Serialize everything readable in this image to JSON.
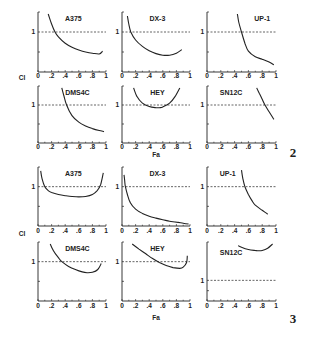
{
  "figures": [
    {
      "number": "2",
      "ylabel": "CI",
      "xlabel": "Fa",
      "panels": [
        {
          "title": "A375",
          "row": 0,
          "col": 0
        },
        {
          "title": "DX-3",
          "row": 0,
          "col": 1
        },
        {
          "title": "UP-1",
          "row": 0,
          "col": 2
        },
        {
          "title": "DMS4C",
          "row": 1,
          "col": 0
        },
        {
          "title": "HEY",
          "row": 1,
          "col": 1
        },
        {
          "title": "SN12C",
          "row": 1,
          "col": 2
        }
      ]
    },
    {
      "number": "3",
      "ylabel": "CI",
      "xlabel": "Fa",
      "panels": [
        {
          "title": "A375",
          "row": 0,
          "col": 0
        },
        {
          "title": "DX-3",
          "row": 0,
          "col": 1
        },
        {
          "title": "UP-1",
          "row": 0,
          "col": 2
        },
        {
          "title": "DMS4C",
          "row": 1,
          "col": 0
        },
        {
          "title": "HEY",
          "row": 1,
          "col": 1
        },
        {
          "title": "SN12C",
          "row": 1,
          "col": 2
        }
      ]
    }
  ],
  "x_tick_labels": [
    "0",
    ".2",
    ".4",
    ".6",
    ".8",
    "1"
  ],
  "y_tick_label": "1",
  "chart_data": [
    {
      "type": "line",
      "title": "Figure 2",
      "xlabel": "Fa",
      "ylabel": "CI",
      "xlim": [
        0,
        1
      ],
      "ylim": [
        0,
        1.5
      ],
      "reference_line": {
        "y": 1,
        "style": "dashed"
      },
      "grid": false,
      "series": [
        {
          "name": "A375",
          "x": [
            0.15,
            0.2,
            0.25,
            0.3,
            0.4,
            0.5,
            0.6,
            0.7,
            0.8,
            0.9,
            0.95
          ],
          "y": [
            1.45,
            1.2,
            1.0,
            0.88,
            0.72,
            0.62,
            0.55,
            0.5,
            0.47,
            0.45,
            0.52
          ]
        },
        {
          "name": "DX-3",
          "x": [
            0.08,
            0.1,
            0.13,
            0.2,
            0.3,
            0.4,
            0.5,
            0.6,
            0.7,
            0.8,
            0.88
          ],
          "y": [
            1.4,
            1.2,
            1.0,
            0.8,
            0.64,
            0.53,
            0.46,
            0.42,
            0.42,
            0.47,
            0.56
          ]
        },
        {
          "name": "UP-1",
          "x": [
            0.44,
            0.46,
            0.5,
            0.55,
            0.6,
            0.7,
            0.8,
            0.9,
            0.97
          ],
          "y": [
            1.45,
            1.25,
            1.0,
            0.72,
            0.52,
            0.38,
            0.32,
            0.25,
            0.18
          ]
        },
        {
          "name": "DMS4C",
          "x": [
            0.35,
            0.38,
            0.42,
            0.5,
            0.6,
            0.7,
            0.8,
            0.9,
            0.97
          ],
          "y": [
            1.45,
            1.25,
            1.0,
            0.72,
            0.55,
            0.45,
            0.38,
            0.33,
            0.3
          ]
        },
        {
          "name": "HEY",
          "x": [
            0.17,
            0.22,
            0.3,
            0.4,
            0.5,
            0.55,
            0.6,
            0.7,
            0.78,
            0.85
          ],
          "y": [
            1.45,
            1.22,
            1.05,
            0.96,
            0.93,
            0.93,
            0.95,
            1.05,
            1.22,
            1.45
          ]
        },
        {
          "name": "SN12C",
          "x": [
            0.72,
            0.76,
            0.8,
            0.84,
            0.9,
            0.97
          ],
          "y": [
            1.45,
            1.3,
            1.15,
            1.0,
            0.82,
            0.62
          ]
        }
      ]
    },
    {
      "type": "line",
      "title": "Figure 3",
      "xlabel": "Fa",
      "ylabel": "CI",
      "xlim": [
        0,
        1
      ],
      "ylim": [
        0,
        1.5
      ],
      "reference_line": {
        "y": 1,
        "style": "dashed"
      },
      "grid": false,
      "series": [
        {
          "name": "A375",
          "x": [
            0.04,
            0.06,
            0.1,
            0.15,
            0.2,
            0.3,
            0.4,
            0.5,
            0.6,
            0.7,
            0.8,
            0.87,
            0.92,
            0.96
          ],
          "y": [
            1.4,
            1.2,
            1.0,
            0.9,
            0.85,
            0.8,
            0.77,
            0.75,
            0.74,
            0.75,
            0.8,
            0.9,
            1.05,
            1.35
          ]
        },
        {
          "name": "DX-3",
          "x": [
            0.03,
            0.04,
            0.05,
            0.08,
            0.12,
            0.2,
            0.3,
            0.4,
            0.5,
            0.6,
            0.7,
            0.8,
            0.9,
            0.98
          ],
          "y": [
            1.3,
            1.15,
            1.0,
            0.8,
            0.6,
            0.43,
            0.32,
            0.25,
            0.2,
            0.16,
            0.12,
            0.1,
            0.07,
            0.05
          ]
        },
        {
          "name": "UP-1",
          "x": [
            0.5,
            0.52,
            0.55,
            0.6,
            0.65,
            0.7,
            0.8,
            0.88
          ],
          "y": [
            1.42,
            1.2,
            1.0,
            0.8,
            0.65,
            0.53,
            0.4,
            0.3
          ]
        },
        {
          "name": "DMS4C",
          "x": [
            0.18,
            0.22,
            0.3,
            0.35,
            0.45,
            0.55,
            0.65,
            0.72,
            0.8,
            0.88,
            0.93
          ],
          "y": [
            1.45,
            1.3,
            1.1,
            1.0,
            0.88,
            0.8,
            0.74,
            0.72,
            0.73,
            0.8,
            0.95
          ]
        },
        {
          "name": "HEY",
          "x": [
            0.15,
            0.25,
            0.35,
            0.45,
            0.55,
            0.65,
            0.75,
            0.85,
            0.9,
            0.95,
            0.96
          ],
          "y": [
            1.45,
            1.32,
            1.2,
            1.08,
            0.98,
            0.9,
            0.85,
            0.83,
            0.86,
            0.98,
            1.15
          ]
        },
        {
          "name": "SN12C",
          "x": [
            0.45,
            0.5,
            0.6,
            0.7,
            0.75,
            0.8,
            0.88,
            0.95
          ],
          "y": [
            1.45,
            1.4,
            1.33,
            1.3,
            1.29,
            1.3,
            1.37,
            1.5
          ],
          "note": "SN12C panel y-axis offset: reference line 1 drawn lower (broken scale)"
        }
      ]
    }
  ]
}
